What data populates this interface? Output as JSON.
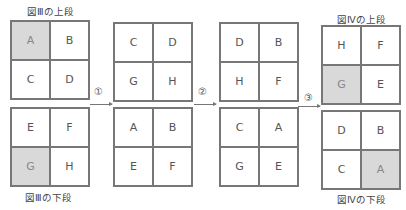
{
  "labels": {
    "fig3_top": "図Ⅲの上段",
    "fig3_bottom": "図Ⅲの下段",
    "fig4_top": "図Ⅳの上段",
    "fig4_bottom": "図Ⅳの下段"
  },
  "steps": [
    "①",
    "②",
    "③"
  ],
  "stages": [
    {
      "top": [
        "A",
        "B",
        "C",
        "D"
      ],
      "bottom": [
        "E",
        "F",
        "G",
        "H"
      ],
      "shaded_top": [
        0
      ],
      "shaded_bottom": [
        2
      ]
    },
    {
      "top": [
        "C",
        "D",
        "G",
        "H"
      ],
      "bottom": [
        "A",
        "B",
        "E",
        "F"
      ]
    },
    {
      "top": [
        "D",
        "B",
        "H",
        "F"
      ],
      "bottom": [
        "C",
        "A",
        "G",
        "E"
      ]
    },
    {
      "top": [
        "H",
        "F",
        "G",
        "E"
      ],
      "bottom": [
        "D",
        "B",
        "C",
        "A"
      ],
      "shaded_top": [
        2
      ],
      "shaded_bottom": [
        3
      ]
    }
  ],
  "colors": {
    "shade": "#d9d9d9",
    "line": "#777777"
  }
}
